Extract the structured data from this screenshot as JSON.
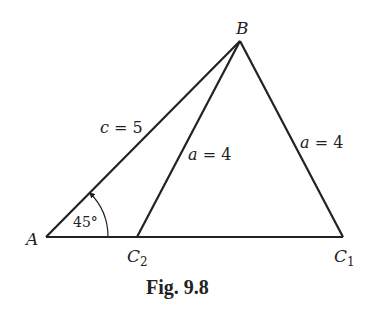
{
  "figure": {
    "caption": "Fig. 9.8",
    "vertices": {
      "A": {
        "label": "A",
        "x": 46,
        "y": 237
      },
      "B": {
        "label": "B",
        "x": 240,
        "y": 41
      },
      "C1": {
        "label": "C",
        "sub": "1",
        "x": 343,
        "y": 237
      },
      "C2": {
        "label": "C",
        "sub": "2",
        "x": 137,
        "y": 237
      }
    },
    "sides": {
      "c": {
        "label": "c = 5",
        "var": "c",
        "value": "5"
      },
      "a_left": {
        "label": "a = 4",
        "var": "a",
        "value": "4"
      },
      "a_right": {
        "label": "a = 4",
        "var": "a",
        "value": "4"
      }
    },
    "angle": {
      "vertex": "A",
      "label": "45°"
    },
    "colors": {
      "line": "#222222",
      "background": "#ffffff"
    }
  }
}
